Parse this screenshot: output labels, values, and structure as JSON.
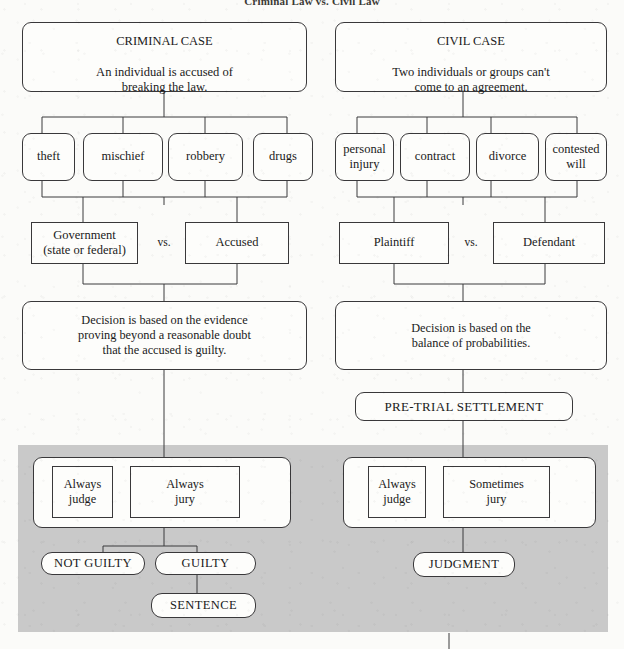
{
  "page": {
    "title": "Criminal Law vs. Civil Law",
    "background_color": "#fbfbf9",
    "shaded_band_color": "#c9c9c9",
    "line_color": "#3a3a3c",
    "text_color": "#1a1a1a"
  },
  "criminal": {
    "header": {
      "heading": "CRIMINAL CASE",
      "body": "An individual is accused of\nbreaking the law."
    },
    "categories": [
      {
        "label": "theft"
      },
      {
        "label": "mischief"
      },
      {
        "label": "robbery"
      },
      {
        "label": "drugs"
      }
    ],
    "parties": {
      "left": "Government\n(state or federal)",
      "vs": "vs.",
      "right": "Accused"
    },
    "standard": "Decision is based on the evidence\nproving beyond a reasonable doubt\nthat the accused is guilty.",
    "trier": {
      "left": "Always\njudge",
      "right": "Always\njury"
    },
    "outcomes": [
      {
        "label": "NOT GUILTY"
      },
      {
        "label": "GUILTY"
      }
    ],
    "final": "SENTENCE"
  },
  "civil": {
    "header": {
      "heading": "CIVIL CASE",
      "body": "Two individuals or groups can't\ncome to an agreement."
    },
    "categories": [
      {
        "label": "personal\ninjury"
      },
      {
        "label": "contract"
      },
      {
        "label": "divorce"
      },
      {
        "label": "contested\nwill"
      }
    ],
    "parties": {
      "left": "Plaintiff",
      "vs": "vs.",
      "right": "Defendant"
    },
    "standard": "Decision is based on the\nbalance of probabilities.",
    "settlement": "PRE-TRIAL SETTLEMENT",
    "trier": {
      "left": "Always\njudge",
      "right": "Sometimes\njury"
    },
    "outcomes": [
      {
        "label": "JUDGMENT"
      }
    ]
  }
}
